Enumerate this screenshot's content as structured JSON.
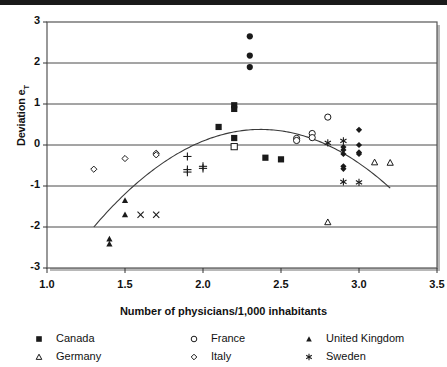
{
  "chart_data": {
    "type": "scatter",
    "title": "",
    "xlabel": "Number of physicians/1,000 inhabitants",
    "ylabel": "Deviation e",
    "ylabel_sub": "T",
    "xlim": [
      1.0,
      3.5
    ],
    "ylim": [
      -3,
      3
    ],
    "xticks": [
      "1.0",
      "1.5",
      "2.0",
      "2.5",
      "3.0",
      "3.5"
    ],
    "xtick_values": [
      1.0,
      1.5,
      2.0,
      2.5,
      3.0,
      3.5
    ],
    "yticks": [
      "3",
      "2",
      "1",
      "0",
      "-1",
      "-2",
      "-3"
    ],
    "ytick_values": [
      3,
      2,
      1,
      0,
      -1,
      -2,
      -3
    ],
    "grid": "horizontal",
    "legend_position": "bottom",
    "series": [
      {
        "name": "Canada",
        "marker": "filled-square",
        "color": "#1a1a1a",
        "points": [
          [
            2.2,
            0.97
          ],
          [
            2.2,
            0.88
          ],
          [
            2.1,
            0.44
          ],
          [
            2.2,
            0.17
          ],
          [
            2.4,
            -0.31
          ],
          [
            2.5,
            -0.35
          ]
        ]
      },
      {
        "name": "Germany",
        "marker": "open-triangle",
        "color": "#1a1a1a",
        "points": [
          [
            2.8,
            -1.88
          ],
          [
            3.1,
            -0.42
          ],
          [
            3.2,
            -0.43
          ]
        ]
      },
      {
        "name": "France",
        "marker": "open-circle",
        "color": "#1a1a1a",
        "points": [
          [
            2.8,
            0.68
          ],
          [
            2.7,
            0.28
          ],
          [
            2.7,
            0.18
          ],
          [
            2.6,
            0.16
          ],
          [
            2.6,
            0.11
          ]
        ]
      },
      {
        "name": "Italy",
        "marker": "open-diamond",
        "color": "#1a1a1a",
        "points": [
          [
            1.3,
            -0.59
          ],
          [
            1.5,
            -0.33
          ],
          [
            1.7,
            -0.2
          ],
          [
            1.7,
            -0.24
          ]
        ]
      },
      {
        "name": "United Kingdom",
        "marker": "filled-triangle",
        "color": "#1a1a1a",
        "points": [
          [
            1.4,
            -2.29
          ],
          [
            1.4,
            -2.41
          ],
          [
            1.5,
            -1.35
          ],
          [
            1.5,
            -1.7
          ]
        ]
      },
      {
        "name": "Sweden",
        "marker": "asterisk",
        "color": "#1a1a1a",
        "points": [
          [
            2.8,
            0.05
          ],
          [
            2.9,
            0.1
          ],
          [
            2.9,
            -0.9
          ],
          [
            3.0,
            -0.91
          ]
        ]
      },
      {
        "name": "United States",
        "marker": "filled-circle",
        "color": "#1a1a1a",
        "points": [
          [
            2.3,
            2.65
          ],
          [
            2.3,
            2.18
          ],
          [
            2.3,
            1.9
          ]
        ]
      },
      {
        "name": "Japan",
        "marker": "open-square",
        "color": "#1a1a1a",
        "points": [
          [
            2.2,
            -0.04
          ]
        ]
      },
      {
        "name": "Australia",
        "marker": "plus",
        "color": "#1a1a1a",
        "points": [
          [
            1.9,
            -0.28
          ],
          [
            1.9,
            -0.6
          ],
          [
            1.9,
            -0.66
          ],
          [
            2.0,
            -0.52
          ],
          [
            2.0,
            -0.57
          ]
        ]
      },
      {
        "name": "Netherlands",
        "marker": "x-cross",
        "color": "#1a1a1a",
        "points": [
          [
            1.6,
            -1.7
          ],
          [
            1.7,
            -1.7
          ]
        ]
      },
      {
        "name": "Switzerland",
        "marker": "filled-diamond",
        "color": "#1a1a1a",
        "points": [
          [
            3.0,
            0.37
          ],
          [
            3.0,
            0.0
          ],
          [
            3.0,
            -0.18
          ],
          [
            3.0,
            -0.22
          ],
          [
            2.9,
            -0.05
          ],
          [
            2.9,
            -0.12
          ],
          [
            2.9,
            -0.22
          ],
          [
            2.9,
            -0.52
          ],
          [
            2.9,
            -0.58
          ]
        ]
      }
    ],
    "fit_curve": {
      "type": "quadratic",
      "description": "inverted parabola fitted through the scatter",
      "vertex": [
        2.37,
        0.38
      ],
      "x_start": 1.3,
      "x_end": 3.2,
      "y_start": -2.0,
      "y_end": -1.0
    }
  },
  "legend": {
    "rows": [
      [
        {
          "label": "Canada",
          "marker": "filled-square"
        },
        {
          "label": "France",
          "marker": "open-circle"
        },
        {
          "label": "United Kingdom",
          "marker": "filled-triangle"
        }
      ],
      [
        {
          "label": "Germany",
          "marker": "open-triangle"
        },
        {
          "label": "Italy",
          "marker": "open-diamond"
        },
        {
          "label": "Sweden",
          "marker": "asterisk"
        }
      ]
    ]
  }
}
